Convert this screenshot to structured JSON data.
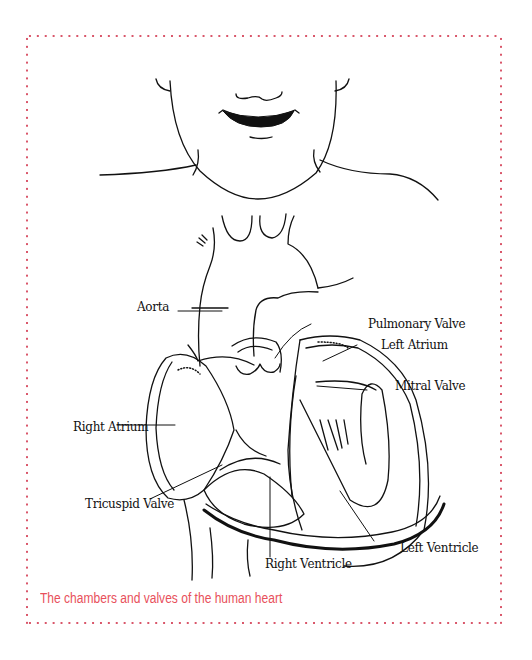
{
  "figure": {
    "caption": "The chambers and valves of the human heart",
    "border_color": "#d9566a",
    "caption_color": "#e8505b"
  },
  "labels": {
    "aorta": "Aorta",
    "pulmonary_valve": "Pulmonary Valve",
    "left_atrium": "Left Atrium",
    "mitral_valve": "Mitral Valve",
    "right_atrium": "Right Atrium",
    "tricuspid_valve": "Tricuspid Valve",
    "right_ventricle": "Right Ventricle",
    "left_ventricle": "Left Ventricle"
  }
}
